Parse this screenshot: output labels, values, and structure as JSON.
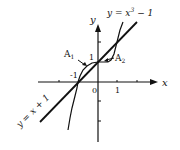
{
  "figure": {
    "axes": {
      "x_label": "x",
      "y_label": "y",
      "tick_labels": {
        "origin": "0",
        "x_one": "1",
        "y_one": "1",
        "y_neg_one": "-1"
      }
    },
    "curves": {
      "line": {
        "label": "y = x + 1",
        "equation": "y = x + 1"
      },
      "cubic": {
        "label_prefix": "y = x",
        "exponent": "3",
        "label_suffix": " − 1",
        "equation": "y = x^3 - 1"
      }
    },
    "regions": {
      "a1": {
        "label": "A",
        "sub": "1"
      },
      "a2": {
        "label": "A",
        "sub": "2"
      }
    },
    "colors": {
      "ink": "#111111",
      "background": "#ffffff"
    }
  }
}
